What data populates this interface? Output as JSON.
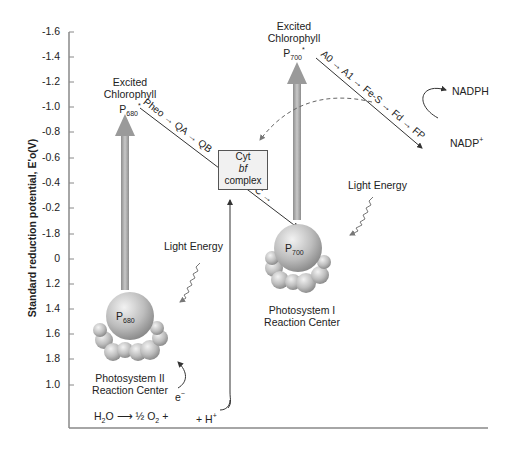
{
  "diagram": {
    "y_axis": {
      "label": "Standard reduction potential, E'o(V)",
      "ticks": [
        "-1.6",
        "-1.4",
        "-1.2",
        "-1.0",
        "-0.8",
        "-0.6",
        "-0.4",
        "-0.2",
        "-1.8",
        "0",
        "1.2",
        "1.4",
        "1.6",
        "1.8",
        "1.0"
      ]
    },
    "photosystem_ii": {
      "excited_label_1": "Excited",
      "excited_label_2": "Chlorophyll",
      "excited_p": "P",
      "excited_sub": "680",
      "excited_star": "*",
      "center_p": "P",
      "center_sub": "680",
      "caption_1": "Photosystem II",
      "caption_2": "Reaction Center",
      "light": "Light Energy"
    },
    "photosystem_i": {
      "excited_label_1": "Excited",
      "excited_label_2": "Chlorophyll",
      "excited_p": "P",
      "excited_sub": "700",
      "excited_star": "*",
      "center_p": "P",
      "center_sub": "700",
      "caption_1": "Photosystem I",
      "caption_2": "Reaction Center",
      "light": "Light Energy"
    },
    "chain_ps2": "Pheo → QA → QB",
    "pc": "PC →",
    "chain_ps1": "A0 → A1 → Fe-S → Fd → FP",
    "cyt": {
      "line1": "Cyt",
      "line2": "bf",
      "line3": "complex"
    },
    "nadph": "NADPH",
    "nadp": "NADP",
    "nadp_sup": "+",
    "water": {
      "h2o": "H",
      "h2o_sub": "2",
      "h2o_o": "O",
      "arrow": "⟶",
      "o2": "½ O",
      "o2_sub": "2",
      "plus1": "+",
      "hplus": "+ H",
      "hplus_sup": "+",
      "electron": "e",
      "electron_sup": "−"
    }
  }
}
